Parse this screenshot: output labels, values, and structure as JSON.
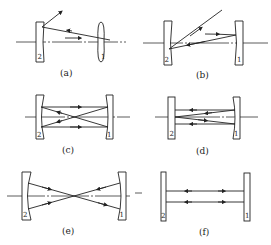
{
  "figure": {
    "panels": [
      {
        "id": "a",
        "caption": "(a)",
        "mirror_left": "2",
        "mirror_right": "1"
      },
      {
        "id": "b",
        "caption": "(b)",
        "mirror_left": "2",
        "mirror_right": "1"
      },
      {
        "id": "c",
        "caption": "(c)",
        "mirror_left": "2",
        "mirror_right": "1"
      },
      {
        "id": "d",
        "caption": "(d)",
        "mirror_left": "2",
        "mirror_right": "1"
      },
      {
        "id": "e",
        "caption": "(e)",
        "mirror_left": "2",
        "mirror_right": "1"
      },
      {
        "id": "f",
        "caption": "(f)",
        "mirror_left": "2",
        "mirror_right": "1"
      }
    ]
  }
}
